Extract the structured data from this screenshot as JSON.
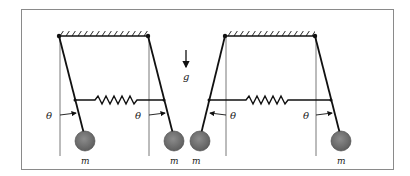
{
  "figure": {
    "gravity_label": "g",
    "angle_label": "θ",
    "mass_label": "m",
    "colors": {
      "frame": "#8a8a8a",
      "line": "#111111",
      "mass": "#6e6e6e",
      "reference": "#555555"
    }
  },
  "left_panel": {
    "configuration": "in-phase",
    "labels": {
      "theta_left": "θ",
      "theta_right": "θ",
      "mass_left": "m",
      "mass_right": "m"
    }
  },
  "right_panel": {
    "configuration": "anti-phase",
    "labels": {
      "theta_left": "θ",
      "theta_right": "θ",
      "mass_left": "m",
      "mass_right": "m"
    }
  }
}
